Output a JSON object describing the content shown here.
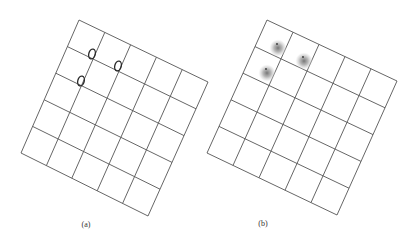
{
  "figure": {
    "panels": [
      {
        "id": "a",
        "caption": "(a)",
        "caption_pos": [
          86,
          224
        ],
        "grid": {
          "rows": 5,
          "cols": 5,
          "corners": {
            "tl": [
              79,
              20
            ],
            "tr": [
              208,
              82
            ],
            "br": [
              148,
              216
            ],
            "bl": [
              21,
              153
            ]
          }
        },
        "markers": {
          "type": "ellipse-outline",
          "color": "#2a2a2a",
          "items": [
            {
              "cx": 92,
              "cy": 54,
              "rx": 3.2,
              "ry": 5
            },
            {
              "cx": 118,
              "cy": 66,
              "rx": 3.2,
              "ry": 5
            },
            {
              "cx": 81,
              "cy": 81,
              "rx": 3.2,
              "ry": 5
            }
          ]
        }
      },
      {
        "id": "b",
        "caption": "(b)",
        "caption_pos": [
          263,
          223
        ],
        "grid": {
          "rows": 5,
          "cols": 5,
          "corners": {
            "tl": [
              267,
              20
            ],
            "tr": [
              397,
              81
            ],
            "br": [
              337,
              215
            ],
            "bl": [
              207,
              153
            ]
          }
        },
        "markers": {
          "type": "gaussian-blob",
          "color": "#8a8a8a",
          "items": [
            {
              "cx": 278,
              "cy": 48,
              "r": 9
            },
            {
              "cx": 304,
              "cy": 61,
              "r": 9
            },
            {
              "cx": 267,
              "cy": 73,
              "r": 9
            }
          ]
        }
      }
    ],
    "grid_color": "#555555"
  }
}
